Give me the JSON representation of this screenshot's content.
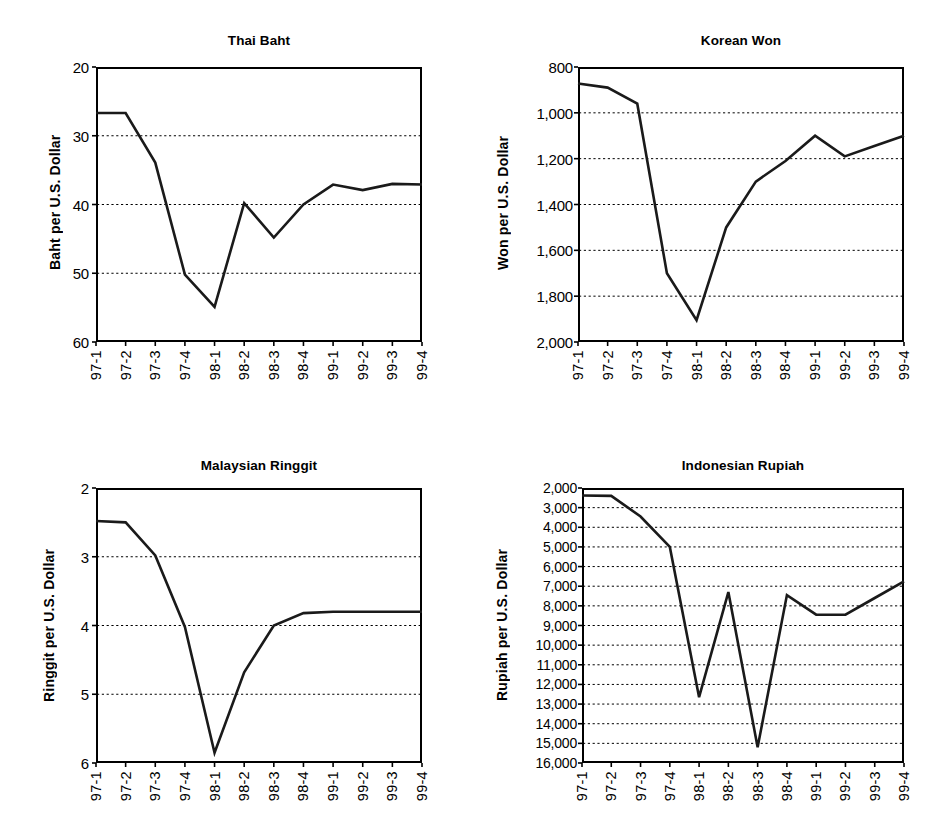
{
  "figure": {
    "width": 937,
    "height": 829,
    "background": "#ffffff",
    "line_color": "#1a1a1a",
    "grid_color": "#000000"
  },
  "chart_data": [
    {
      "id": "thai-baht",
      "type": "line",
      "title": "Thai Baht",
      "xlabel": "",
      "ylabel": "Baht per U.S. Dollar",
      "y_inverted": true,
      "ylim": [
        20,
        60
      ],
      "yticks": [
        20,
        30,
        40,
        50,
        60
      ],
      "ytick_labels": [
        "20",
        "30",
        "40",
        "50",
        "60"
      ],
      "gridlines": [
        30,
        40,
        50
      ],
      "grid": true,
      "legend": "none",
      "categories": [
        "97-1",
        "97-2",
        "97-3",
        "97-4",
        "98-1",
        "98-2",
        "98-3",
        "98-4",
        "99-1",
        "99-2",
        "99-3",
        "99-4"
      ],
      "values": [
        26.7,
        26.7,
        33.9,
        50.2,
        54.9,
        39.8,
        44.8,
        40.0,
        37.1,
        37.9,
        37.0,
        37.1
      ]
    },
    {
      "id": "korean-won",
      "type": "line",
      "title": "Korean Won",
      "xlabel": "",
      "ylabel": "Won per U.S. Dollar",
      "y_inverted": true,
      "ylim": [
        800,
        2000
      ],
      "yticks": [
        800,
        1000,
        1200,
        1400,
        1600,
        1800,
        2000
      ],
      "ytick_labels": [
        "800",
        "1,000",
        "1,200",
        "1,400",
        "1,600",
        "1,800",
        "2,000"
      ],
      "gridlines": [
        1000,
        1200,
        1400,
        1600,
        1800
      ],
      "grid": true,
      "legend": "none",
      "categories": [
        "97-1",
        "97-2",
        "97-3",
        "97-4",
        "98-1",
        "98-2",
        "98-3",
        "98-4",
        "99-1",
        "99-2",
        "99-3",
        "99-4"
      ],
      "values": [
        872,
        890,
        960,
        1700,
        1905,
        1500,
        1300,
        1210,
        1100,
        1190,
        1145,
        1100
      ]
    },
    {
      "id": "malaysian-ringgit",
      "type": "line",
      "title": "Malaysian Ringgit",
      "xlabel": "",
      "ylabel": "Ringgit per U.S. Dollar",
      "y_inverted": true,
      "ylim": [
        2,
        6
      ],
      "yticks": [
        2,
        3,
        4,
        5,
        6
      ],
      "ytick_labels": [
        "2",
        "3",
        "4",
        "5",
        "6"
      ],
      "gridlines": [
        3,
        4,
        5
      ],
      "grid": true,
      "legend": "none",
      "categories": [
        "97-1",
        "97-2",
        "97-3",
        "97-4",
        "98-1",
        "98-2",
        "98-3",
        "98-4",
        "99-1",
        "99-2",
        "99-3",
        "99-4"
      ],
      "values": [
        2.48,
        2.5,
        2.98,
        4.02,
        5.85,
        4.68,
        4.0,
        3.82,
        3.8,
        3.8,
        3.8,
        3.8
      ]
    },
    {
      "id": "indonesian-rupiah",
      "type": "line",
      "title": "Indonesian Rupiah",
      "xlabel": "",
      "ylabel": "Rupiah per U.S. Dollar",
      "y_inverted": true,
      "ylim": [
        2000,
        16000
      ],
      "yticks": [
        2000,
        3000,
        4000,
        5000,
        6000,
        7000,
        8000,
        9000,
        10000,
        11000,
        12000,
        13000,
        14000,
        15000,
        16000
      ],
      "ytick_labels": [
        "2,000",
        "3,000",
        "4,000",
        "5,000",
        "6,000",
        "7,000",
        "8,000",
        "9,000",
        "10,000",
        "11,000",
        "12,000",
        "13,000",
        "14,000",
        "15,000",
        "16,000"
      ],
      "gridlines": [
        3000,
        4000,
        5000,
        6000,
        7000,
        8000,
        9000,
        10000,
        11000,
        12000,
        13000,
        14000,
        15000
      ],
      "grid": true,
      "legend": "none",
      "categories": [
        "97-1",
        "97-2",
        "97-3",
        "97-4",
        "98-1",
        "98-2",
        "98-3",
        "98-4",
        "99-1",
        "99-2",
        "99-3",
        "99-4"
      ],
      "values": [
        2380,
        2400,
        3450,
        5000,
        12650,
        7300,
        15200,
        7450,
        8450,
        8450,
        7600,
        6750
      ]
    }
  ]
}
